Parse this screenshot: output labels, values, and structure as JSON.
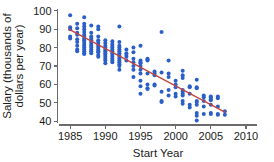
{
  "chart_data": {
    "type": "scatter",
    "title": "",
    "subtitle": "",
    "xlabel": "Start Year",
    "ylabel": "Salary (thousands of dollars per year)",
    "ylabel_lines": [
      "Salary (thousands of",
      "dollars per year)"
    ],
    "xlim": [
      1983.2,
      2011.5
    ],
    "ylim": [
      38.0,
      101.5
    ],
    "xticks": [
      1985,
      1990,
      1995,
      2000,
      2005,
      2010
    ],
    "xtick_labels": [
      "1985",
      "1990",
      "1995",
      "2000",
      "2005",
      "2010"
    ],
    "yticks": [
      40,
      50,
      60,
      70,
      80,
      90,
      100
    ],
    "ytick_labels": [
      "40",
      "50",
      "60",
      "70",
      "80",
      "90",
      "100"
    ],
    "grid": false,
    "legend": false,
    "legend_position": "none",
    "point_color": "#2a5fc8",
    "point_marker": "circle",
    "point_radius": 2.0,
    "trendline": {
      "name": "least-squares fit",
      "color": "#c0453f",
      "x_start": 1984.8,
      "y_start": 90.0,
      "x_end": 2007.0,
      "y_end": 45.0,
      "slope": -2.027,
      "intercept": 90.0
    },
    "points": [
      [
        1985,
        97.5
      ],
      [
        1985,
        91.0
      ],
      [
        1985,
        90.0
      ],
      [
        1985,
        86.0
      ],
      [
        1985,
        85.0
      ],
      [
        1986,
        93.0
      ],
      [
        1986,
        90.5
      ],
      [
        1986,
        88.0
      ],
      [
        1986,
        87.0
      ],
      [
        1986,
        84.5
      ],
      [
        1986,
        83.0
      ],
      [
        1986,
        81.0
      ],
      [
        1986,
        79.0
      ],
      [
        1986,
        78.0
      ],
      [
        1987,
        96.5
      ],
      [
        1987,
        93.0
      ],
      [
        1987,
        91.5
      ],
      [
        1987,
        90.0
      ],
      [
        1987,
        88.5
      ],
      [
        1987,
        87.0
      ],
      [
        1987,
        86.0
      ],
      [
        1987,
        85.0
      ],
      [
        1987,
        84.0
      ],
      [
        1987,
        83.0
      ],
      [
        1987,
        82.0
      ],
      [
        1987,
        81.0
      ],
      [
        1987,
        80.0
      ],
      [
        1987,
        79.0
      ],
      [
        1987,
        78.0
      ],
      [
        1987,
        77.0
      ],
      [
        1987,
        76.5
      ],
      [
        1988,
        92.0
      ],
      [
        1988,
        88.0
      ],
      [
        1988,
        86.0
      ],
      [
        1988,
        85.0
      ],
      [
        1988,
        84.0
      ],
      [
        1988,
        83.0
      ],
      [
        1988,
        82.0
      ],
      [
        1988,
        81.0
      ],
      [
        1988,
        80.0
      ],
      [
        1988,
        79.0
      ],
      [
        1988,
        78.0
      ],
      [
        1988,
        77.0
      ],
      [
        1989,
        91.5
      ],
      [
        1989,
        90.0
      ],
      [
        1989,
        86.0
      ],
      [
        1989,
        84.0
      ],
      [
        1989,
        83.0
      ],
      [
        1989,
        82.0
      ],
      [
        1989,
        81.0
      ],
      [
        1989,
        80.0
      ],
      [
        1989,
        79.0
      ],
      [
        1989,
        78.0
      ],
      [
        1989,
        77.5
      ],
      [
        1989,
        76.0
      ],
      [
        1989,
        75.0
      ],
      [
        1990,
        84.0
      ],
      [
        1990,
        82.5
      ],
      [
        1990,
        81.0
      ],
      [
        1990,
        80.0
      ],
      [
        1990,
        79.0
      ],
      [
        1990,
        78.0
      ],
      [
        1990,
        77.0
      ],
      [
        1990,
        76.0
      ],
      [
        1990,
        75.0
      ],
      [
        1990,
        74.0
      ],
      [
        1990,
        73.0
      ],
      [
        1990,
        71.5
      ],
      [
        1991,
        83.5
      ],
      [
        1991,
        82.0
      ],
      [
        1991,
        81.0
      ],
      [
        1991,
        80.0
      ],
      [
        1991,
        79.0
      ],
      [
        1991,
        78.0
      ],
      [
        1991,
        77.0
      ],
      [
        1991,
        76.0
      ],
      [
        1991,
        75.0
      ],
      [
        1991,
        74.0
      ],
      [
        1991,
        73.0
      ],
      [
        1991,
        72.0
      ],
      [
        1992,
        91.5
      ],
      [
        1992,
        83.0
      ],
      [
        1992,
        81.0
      ],
      [
        1992,
        80.0
      ],
      [
        1992,
        79.0
      ],
      [
        1992,
        78.0
      ],
      [
        1992,
        77.0
      ],
      [
        1992,
        76.0
      ],
      [
        1992,
        75.0
      ],
      [
        1992,
        74.0
      ],
      [
        1992,
        73.0
      ],
      [
        1992,
        72.0
      ],
      [
        1992,
        71.0
      ],
      [
        1992,
        70.0
      ],
      [
        1992,
        68.0
      ],
      [
        1993,
        79.0
      ],
      [
        1993,
        77.0
      ],
      [
        1993,
        76.0
      ],
      [
        1993,
        75.0
      ],
      [
        1993,
        73.0
      ],
      [
        1994,
        80.0
      ],
      [
        1994,
        77.5
      ],
      [
        1994,
        74.0
      ],
      [
        1994,
        72.0
      ],
      [
        1994,
        70.0
      ],
      [
        1994,
        68.0
      ],
      [
        1994,
        64.0
      ],
      [
        1995,
        81.0
      ],
      [
        1995,
        73.0
      ],
      [
        1995,
        72.0
      ],
      [
        1995,
        71.5
      ],
      [
        1995,
        70.0
      ],
      [
        1995,
        68.0
      ],
      [
        1995,
        66.0
      ],
      [
        1995,
        62.0
      ],
      [
        1995,
        59.0
      ],
      [
        1995,
        55.0
      ],
      [
        1996,
        74.0
      ],
      [
        1996,
        73.5
      ],
      [
        1996,
        73.0
      ],
      [
        1996,
        66.0
      ],
      [
        1996,
        60.0
      ],
      [
        1996,
        58.0
      ],
      [
        1996,
        57.5
      ],
      [
        1997,
        67.0
      ],
      [
        1997,
        66.0
      ],
      [
        1997,
        65.0
      ],
      [
        1997,
        60.0
      ],
      [
        1997,
        59.5
      ],
      [
        1998,
        88.5
      ],
      [
        1998,
        66.5
      ],
      [
        1998,
        56.0
      ],
      [
        1998,
        51.0
      ],
      [
        1998,
        50.5
      ],
      [
        1999,
        73.0
      ],
      [
        1999,
        66.0
      ],
      [
        1999,
        64.0
      ],
      [
        1999,
        57.0
      ],
      [
        1999,
        54.0
      ],
      [
        2000,
        62.0
      ],
      [
        2000,
        60.0
      ],
      [
        2000,
        58.5
      ],
      [
        2000,
        55.0
      ],
      [
        2000,
        53.5
      ],
      [
        2001,
        67.5
      ],
      [
        2001,
        65.0
      ],
      [
        2001,
        63.5
      ],
      [
        2001,
        57.0
      ],
      [
        2001,
        56.0
      ],
      [
        2001,
        55.0
      ],
      [
        2001,
        54.0
      ],
      [
        2001,
        51.0
      ],
      [
        2001,
        49.5
      ],
      [
        2002,
        59.0
      ],
      [
        2002,
        58.5
      ],
      [
        2002,
        55.0
      ],
      [
        2002,
        49.0
      ],
      [
        2002,
        47.5
      ],
      [
        2003,
        62.5
      ],
      [
        2003,
        58.5
      ],
      [
        2003,
        58.0
      ],
      [
        2003,
        51.0
      ],
      [
        2003,
        50.5
      ],
      [
        2003,
        49.0
      ],
      [
        2003,
        44.5
      ],
      [
        2003,
        43.0
      ],
      [
        2003,
        40.5
      ],
      [
        2004,
        54.0
      ],
      [
        2004,
        53.0
      ],
      [
        2004,
        51.0
      ],
      [
        2004,
        48.0
      ],
      [
        2004,
        44.0
      ],
      [
        2005,
        53.5
      ],
      [
        2005,
        53.0
      ],
      [
        2005,
        52.0
      ],
      [
        2005,
        51.5
      ],
      [
        2005,
        49.0
      ],
      [
        2005,
        44.5
      ],
      [
        2005,
        44.0
      ],
      [
        2006,
        53.5
      ],
      [
        2006,
        52.5
      ],
      [
        2006,
        48.0
      ],
      [
        2006,
        44.0
      ],
      [
        2006,
        43.5
      ],
      [
        2007,
        45.5
      ],
      [
        2007,
        43.5
      ]
    ]
  }
}
